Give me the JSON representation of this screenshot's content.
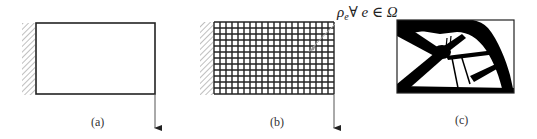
{
  "figure": {
    "panels": [
      {
        "id": "a",
        "label": "(a)",
        "description": "Design domain with fixed left support and downward point load at bottom-right corner"
      },
      {
        "id": "b",
        "label": "(b)",
        "description": "Discretized finite-element mesh of the design domain",
        "mesh": {
          "columns": 20,
          "rows": 12
        }
      },
      {
        "id": "c",
        "label": "(c)",
        "description": "Optimized topology result showing material layout"
      }
    ],
    "callout": {
      "symbol": "ρ",
      "subscript": "e",
      "rest": "∀ e ∈ Ω"
    },
    "colors": {
      "stroke": "#222222",
      "hatch": "#888888",
      "material": "#000000",
      "background": "#ffffff",
      "leader": "#999999"
    }
  }
}
